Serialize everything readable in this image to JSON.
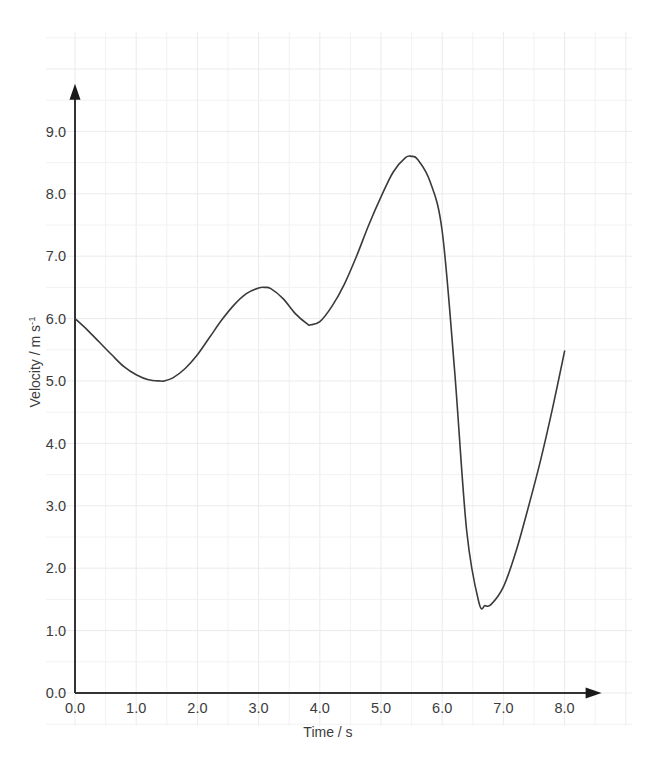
{
  "chart_data": {
    "type": "line",
    "title": "",
    "xlabel": "Time / s",
    "ylabel": "Velocity / m s",
    "ylabel_sup": "-1",
    "xlim": [
      0.0,
      8.0
    ],
    "ylim": [
      0.0,
      9.7
    ],
    "grid": true,
    "grid_minor_step_x": 0.5,
    "grid_minor_step_y": 0.5,
    "legend": "none",
    "xticks": [
      "0.0",
      "1.0",
      "2.0",
      "3.0",
      "4.0",
      "5.0",
      "6.0",
      "7.0",
      "8.0"
    ],
    "xtick_values": [
      0.0,
      1.0,
      2.0,
      3.0,
      4.0,
      5.0,
      6.0,
      7.0,
      8.0
    ],
    "yticks": [
      "0.0",
      "1.0",
      "2.0",
      "3.0",
      "4.0",
      "5.0",
      "6.0",
      "7.0",
      "8.0",
      "9.0"
    ],
    "ytick_values": [
      0.0,
      1.0,
      2.0,
      3.0,
      4.0,
      5.0,
      6.0,
      7.0,
      8.0,
      9.0
    ],
    "series": [
      {
        "name": "velocity",
        "color": "#3a3a3a",
        "x": [
          0.0,
          0.2,
          0.4,
          0.6,
          0.8,
          1.0,
          1.2,
          1.4,
          1.45,
          1.6,
          1.8,
          2.0,
          2.2,
          2.4,
          2.6,
          2.8,
          3.0,
          3.1,
          3.2,
          3.4,
          3.6,
          3.8,
          3.85,
          4.0,
          4.2,
          4.4,
          4.6,
          4.8,
          5.0,
          5.2,
          5.4,
          5.5,
          5.6,
          5.8,
          6.0,
          6.2,
          6.4,
          6.6,
          6.7,
          6.8,
          7.0,
          7.2,
          7.4,
          7.6,
          7.8,
          8.0
        ],
        "y": [
          6.0,
          5.82,
          5.62,
          5.42,
          5.23,
          5.1,
          5.02,
          5.0,
          5.0,
          5.05,
          5.2,
          5.42,
          5.7,
          5.98,
          6.22,
          6.4,
          6.49,
          6.5,
          6.48,
          6.32,
          6.08,
          5.91,
          5.9,
          5.95,
          6.2,
          6.55,
          7.0,
          7.5,
          7.95,
          8.35,
          8.58,
          8.6,
          8.55,
          8.2,
          7.4,
          5.2,
          2.6,
          1.45,
          1.4,
          1.42,
          1.7,
          2.25,
          2.95,
          3.7,
          4.55,
          5.48
        ],
        "annotations": {
          "start_point": [
            0.0,
            6.0
          ],
          "local_min_1": [
            1.45,
            5.0
          ],
          "local_max_1": [
            3.1,
            6.5
          ],
          "local_min_2": [
            3.85,
            5.9
          ],
          "global_max": [
            5.45,
            8.6
          ],
          "global_min": [
            6.65,
            1.4
          ],
          "end_point": [
            8.0,
            5.48
          ]
        }
      }
    ],
    "colors": {
      "curve": "#3a3a3a",
      "axis": "#333333",
      "grid_minor": "#f2f2f2",
      "grid_major": "#ebebeb",
      "text": "#3c3c3c",
      "background": "#ffffff"
    }
  }
}
